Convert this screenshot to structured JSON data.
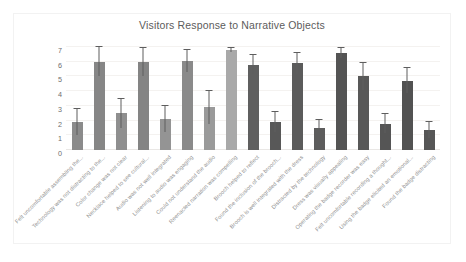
{
  "chart_data": {
    "type": "bar",
    "title": "Visitors Response to Narrative Objects",
    "xlabel": "",
    "ylabel": "",
    "ylim": [
      0,
      7
    ],
    "yticks": [
      0,
      1,
      2,
      3,
      4,
      5,
      6,
      7
    ],
    "grid": true,
    "legend": "none",
    "orientation": "vertical",
    "xtick_rotation": -45,
    "categories": [
      "Felt uncomfortable assembling the...",
      "Technology was not distracting to the...",
      "Color change was not clear",
      "Necklace helped to see cultural...",
      "Audio was not well integrated",
      "Listening to audio was engaging",
      "Could not understand the audio",
      "Reenacted narration was compelling",
      "Brooch helped to reflect",
      "Found the inclusion of the brooch...",
      "Brooch is well integrated with the dress",
      "Distracted by the technology",
      "Dress was visually appealing",
      "Operating the badge recorder was easy",
      "Felt uncomfortable recording a thought...",
      "Using the badge elicited an emotional...",
      "Found the badge distracting"
    ],
    "values": [
      1.9,
      6.0,
      2.5,
      6.0,
      2.1,
      6.05,
      2.9,
      6.8,
      5.8,
      1.9,
      5.9,
      1.5,
      6.6,
      5.0,
      1.8,
      4.7,
      1.35
    ],
    "error_upper": [
      0.9,
      1.0,
      1.0,
      0.95,
      0.9,
      0.75,
      1.1,
      0.15,
      0.65,
      0.65,
      0.7,
      0.55,
      0.35,
      0.9,
      0.65,
      0.85,
      0.55
    ],
    "error_lower": [
      0.9,
      1.0,
      1.0,
      0.95,
      0.9,
      0.75,
      1.1,
      0.15,
      0.65,
      0.65,
      0.7,
      0.55,
      0.35,
      0.9,
      0.65,
      0.85,
      0.55
    ],
    "bar_colors": [
      "#8b8b8b",
      "#868686",
      "#8f8f8f",
      "#848484",
      "#949494",
      "#8a8a8a",
      "#9a9a9a",
      "#a9a9a9",
      "#5f5f5f",
      "#585858",
      "#5b5b5b",
      "#5d5d5d",
      "#545454",
      "#585858",
      "#555555",
      "#525252",
      "#565656"
    ]
  },
  "colors": {
    "background": "#ffffff",
    "title_text": "#5c5c5c",
    "tick_text": "#6e6e6e",
    "label_text": "#8d8d8d",
    "gridline": "#f4f2f0",
    "error_bar": "#5e5e5e",
    "frame": "#f2f2f2"
  }
}
